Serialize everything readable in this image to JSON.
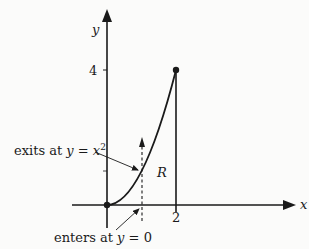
{
  "diagram": {
    "axes": {
      "x_label": "x",
      "y_label": "y",
      "x_tick_label": "2",
      "y_tick_label": "4"
    },
    "region_label": "R",
    "curve": {
      "equation": "y = x^2",
      "from_x": 0,
      "to_x": 2
    },
    "annotations": {
      "exits": {
        "prefix": "exits at ",
        "var": "y",
        "eq": " = ",
        "expr_base": "x",
        "expr_sup": "2"
      },
      "enters": {
        "prefix": "enters at ",
        "var": "y",
        "eq": " = ",
        "value": "0"
      }
    },
    "colors": {
      "ink": "#1a1a1a",
      "background": "#fbfbfa"
    }
  }
}
